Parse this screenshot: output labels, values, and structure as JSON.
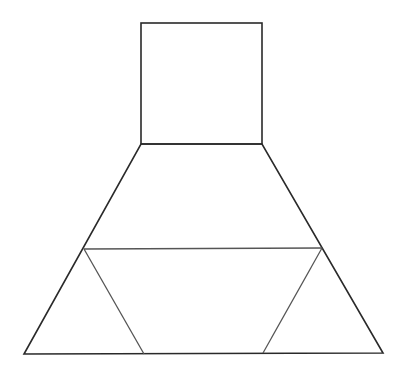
{
  "diagram": {
    "colors": {
      "line": "#2a2a2a",
      "inner_line": "#555555",
      "background": "#ffffff"
    },
    "shapes": {
      "square": {
        "x1": 141,
        "y1": 23,
        "x2": 262,
        "y2": 144
      },
      "trapezoid": {
        "top_left": [
          141,
          144
        ],
        "top_right": [
          262,
          144
        ],
        "bottom_right": [
          383,
          353
        ],
        "bottom_left": [
          24,
          354
        ]
      },
      "horizontal_line": {
        "left": [
          84,
          249
        ],
        "right": [
          322,
          248
        ]
      },
      "left_diagonal": {
        "from": [
          84,
          249
        ],
        "to": [
          144,
          354
        ]
      },
      "right_diagonal": {
        "from": [
          322,
          248
        ],
        "to": [
          263,
          353
        ]
      }
    }
  }
}
